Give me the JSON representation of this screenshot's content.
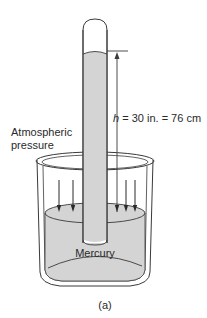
{
  "diagram": {
    "labels": {
      "height_var": "h",
      "height_value": " = 30 in. = 76 cm",
      "atmospheric_line1": "Atmospheric",
      "atmospheric_line2": "pressure",
      "mercury": "Mercury",
      "caption": "(a)"
    },
    "colors": {
      "mercury_fill": "#d4d4d4",
      "line": "#3a3a3a",
      "glass": "#ffffff"
    },
    "measurement": {
      "height_in": 30,
      "height_cm": 76
    },
    "arrows_count": 5
  }
}
